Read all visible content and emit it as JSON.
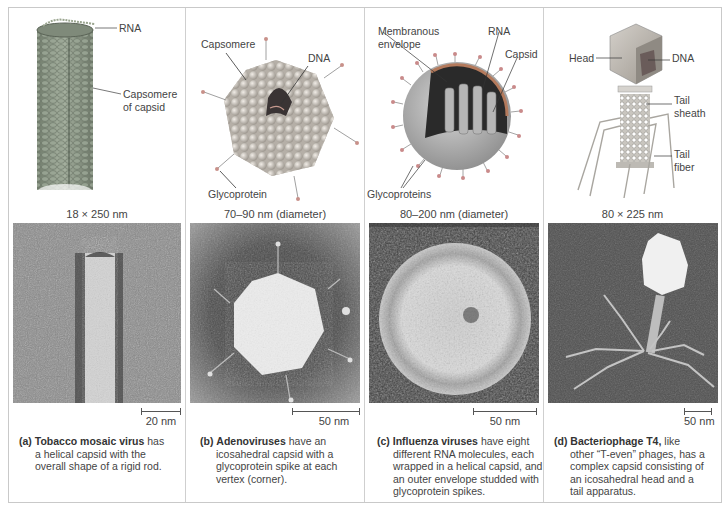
{
  "figure": {
    "panels": [
      {
        "id": "a",
        "letter": "(a)",
        "name": "Tobacco mosaic virus",
        "callouts": [
          "RNA",
          "Capsomere",
          "of capsid"
        ],
        "dimensions": "18 × 250 nm",
        "scale_bar": "20 nm",
        "caption_lines": [
          "has",
          "a helical capsid with the",
          "overall shape of a rigid rod."
        ]
      },
      {
        "id": "b",
        "letter": "(b)",
        "name": "Adenoviruses",
        "callouts": [
          "Capsomere",
          "DNA",
          "Glycoprotein"
        ],
        "dimensions": "70–90 nm (diameter)",
        "scale_bar": "50 nm",
        "caption_lines": [
          "have an",
          "icosahedral capsid with a",
          "glycoprotein spike at each",
          "vertex (corner)."
        ]
      },
      {
        "id": "c",
        "letter": "(c)",
        "name": "Influenza viruses",
        "callouts": [
          "Membranous",
          "envelope",
          "RNA",
          "Capsid",
          "Glycoproteins"
        ],
        "dimensions": "80–200 nm (diameter)",
        "scale_bar": "50 nm",
        "caption_lines": [
          "have eight",
          "different RNA molecules, each",
          "wrapped in a helical capsid, and",
          "an outer envelope studded with",
          "glycoprotein spikes."
        ]
      },
      {
        "id": "d",
        "letter": "(d)",
        "name": "Bacteriophage T4,",
        "callouts": [
          "Head",
          "DNA",
          "Tail",
          "sheath",
          "Tail",
          "fiber"
        ],
        "dimensions": "80 × 225 nm",
        "scale_bar": "50 nm",
        "caption_lines": [
          "like",
          "other “T-even” phages, has a",
          "complex capsid consisting of",
          "an icosahedral head and a",
          "tail apparatus."
        ]
      }
    ]
  }
}
